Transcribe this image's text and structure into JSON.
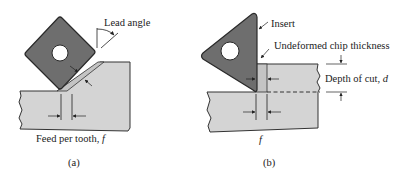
{
  "figure": {
    "colors": {
      "insert_fill": "#6e6e6e",
      "insert_stroke": "#2a2a2a",
      "workpiece_fill": "#d4d4d4",
      "chip_fill": "#c4c4c4",
      "line": "#222222",
      "background": "#ffffff"
    },
    "panel_a": {
      "caption": "(a)",
      "labels": {
        "lead_angle": "Lead angle",
        "feed_prefix": "Feed per tooth, ",
        "feed_symbol": "f"
      },
      "elements": [
        "square-insert",
        "insert-hole",
        "workpiece",
        "chip",
        "lead-angle-arc",
        "feed-dimension",
        "chip-thickness-dimension"
      ]
    },
    "panel_b": {
      "caption": "(b)",
      "labels": {
        "insert": "Insert",
        "undeformed_chip_thickness": "Undeformed chip thickness",
        "depth_prefix": "Depth of cut, ",
        "depth_symbol": "d",
        "feed_symbol": "f"
      },
      "elements": [
        "triangular-insert",
        "insert-hole",
        "workpiece",
        "chip",
        "depth-dimension",
        "feed-dimension",
        "chip-thickness-dimension"
      ]
    }
  }
}
